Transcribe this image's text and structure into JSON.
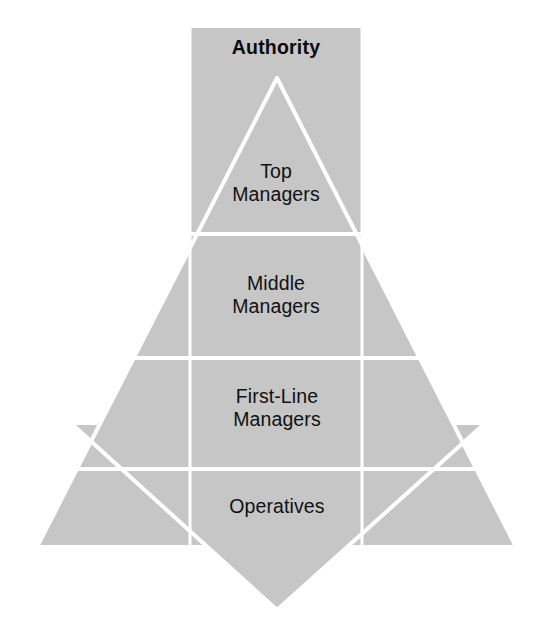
{
  "figure": {
    "title_label": "Authority",
    "fill_color": "#c6c6c6",
    "divider_color": "#ffffff",
    "background_color": "#ffffff",
    "text_color": "#111111",
    "levels": [
      {
        "id": "top-managers",
        "label": "Top\nManagers"
      },
      {
        "id": "middle-managers",
        "label": "Middle\nManagers"
      },
      {
        "id": "first-line-managers",
        "label": "First-Line\nManagers"
      },
      {
        "id": "operatives",
        "label": "Operatives"
      }
    ]
  }
}
